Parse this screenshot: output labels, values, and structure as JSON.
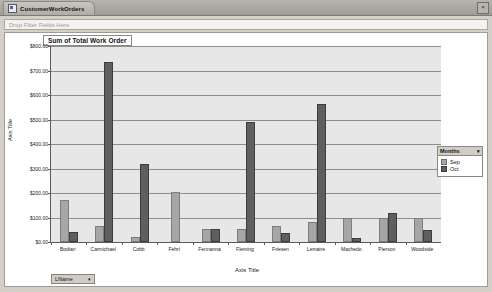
{
  "window": {
    "tab_title": "CustomerWorkOrders",
    "close_label": "×",
    "tab_icon": "pivot-chart-icon"
  },
  "filter_bar": {
    "placeholder": "Drop Filter Fields Here"
  },
  "legend": {
    "title": "Months",
    "caret": "▾",
    "items": [
      {
        "label": "Sep",
        "color": "#a6a6a6"
      },
      {
        "label": "Oct",
        "color": "#5f5f5f"
      }
    ]
  },
  "field_button": {
    "label": "LName",
    "caret": "▾"
  },
  "chart_data": {
    "type": "bar",
    "title": "Sum of Total Work Order",
    "xlabel": "Axis Title",
    "ylabel": "Axis Title",
    "ylim": [
      0,
      800
    ],
    "ytick_labels": [
      "$800.00",
      "$700.00",
      "$600.00",
      "$500.00",
      "$400.00",
      "$300.00",
      "$200.00",
      "$100.00",
      "$0.00"
    ],
    "ytick_values": [
      800,
      700,
      600,
      500,
      400,
      300,
      200,
      100,
      0
    ],
    "grid": true,
    "legend_position": "right",
    "categories": [
      "Bodian",
      "Carmichael",
      "Cobb",
      "Fehri",
      "Fennanna",
      "Fleming",
      "Friesen",
      "Lemaire",
      "Machedo",
      "Pierson",
      "Woodside"
    ],
    "series": [
      {
        "name": "Sep",
        "color": "#a6a6a6",
        "values": [
          170,
          65,
          20,
          205,
          55,
          55,
          65,
          80,
          100,
          100,
          100
        ]
      },
      {
        "name": "Oct",
        "color": "#5f5f5f",
        "values": [
          40,
          735,
          320,
          0,
          55,
          490,
          35,
          565,
          15,
          120,
          50
        ]
      }
    ]
  }
}
